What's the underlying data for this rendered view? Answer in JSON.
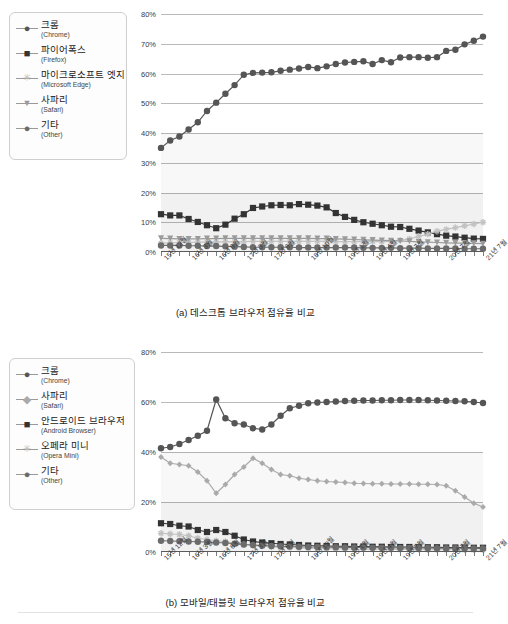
{
  "figures": [
    {
      "id": "a",
      "caption": "(a) 데스크톱 브라우저 점유율 비교",
      "legend": [
        {
          "ko": "크롬",
          "en": "(Chrome)",
          "marker": "circle",
          "color": "#555555"
        },
        {
          "ko": "파이어폭스",
          "en": "(Firefox)",
          "marker": "square",
          "color": "#333333"
        },
        {
          "ko": "마이크로소프트 엣지",
          "en": "(Microsoft Edge)",
          "marker": "star",
          "color": "#bfbfbf"
        },
        {
          "ko": "사파리",
          "en": "(Safari)",
          "marker": "triangle-down",
          "color": "#9a9a9a"
        },
        {
          "ko": "기타",
          "en": "(Other)",
          "marker": "circle",
          "color": "#6b6b6b"
        }
      ],
      "chart_data": {
        "type": "line",
        "title": "",
        "subtitle": "",
        "xlabel": "",
        "ylabel": "",
        "ylim": [
          0,
          80
        ],
        "yticks": [
          "0%",
          "10%",
          "20%",
          "30%",
          "40%",
          "50%",
          "60%",
          "70%",
          "80%"
        ],
        "ytick_values": [
          0,
          10,
          20,
          30,
          40,
          50,
          60,
          70,
          80
        ],
        "grid": true,
        "legend_position": "outside-left",
        "x_tick_labels": [
          "15년 12월",
          "16년 3월",
          "16년 6월",
          "17년 3월",
          "17년 6월",
          "18년 10월",
          "19년 1월",
          "19년 4월",
          "19년 7월",
          "20년 7월",
          "21년 7월"
        ],
        "x_tick_indices": [
          0,
          3,
          6,
          9,
          12,
          16,
          20,
          23,
          26,
          31,
          35
        ],
        "n_points": 36,
        "series": [
          {
            "name": "크롬 (Chrome)",
            "marker": "circle",
            "color": "#555555",
            "values": [
              35.0,
              37.5,
              38.8,
              41.2,
              43.6,
              47.4,
              50.2,
              53.2,
              56.1,
              59.6,
              60.2,
              60.3,
              60.4,
              60.9,
              61.3,
              61.7,
              62.2,
              61.8,
              62.4,
              63.2,
              63.7,
              63.9,
              64.1,
              63.2,
              64.5,
              63.8,
              65.4,
              65.5,
              65.5,
              65.3,
              65.5,
              67.6,
              68.0,
              69.8,
              71.0,
              72.4
            ]
          },
          {
            "name": "파이어폭스 (Firefox)",
            "marker": "square",
            "color": "#333333",
            "values": [
              12.7,
              12.3,
              12.3,
              11.1,
              10.1,
              9.0,
              8.0,
              9.2,
              11.2,
              12.7,
              14.8,
              15.3,
              15.7,
              15.8,
              15.7,
              16.1,
              15.9,
              15.6,
              15.0,
              13.1,
              11.8,
              10.8,
              10.0,
              9.5,
              9.0,
              8.5,
              8.4,
              7.8,
              7.2,
              6.6,
              6.0,
              5.5,
              5.2,
              4.8,
              4.5,
              4.4
            ]
          },
          {
            "name": "마이크로소프트 엣지 (Microsoft Edge)",
            "marker": "star",
            "color": "#c2c2c2",
            "values": [
              3.0,
              3.1,
              3.2,
              3.2,
              3.3,
              3.3,
              3.4,
              3.4,
              3.5,
              3.5,
              3.6,
              3.6,
              3.6,
              3.6,
              3.6,
              3.6,
              3.6,
              3.6,
              3.6,
              3.5,
              3.5,
              3.5,
              3.5,
              3.5,
              3.5,
              3.6,
              4.0,
              4.4,
              5.2,
              6.0,
              7.0,
              7.6,
              8.2,
              8.8,
              9.4,
              10.0
            ]
          },
          {
            "name": "사파리 (Safari)",
            "marker": "triangle-down",
            "color": "#9a9a9a",
            "values": [
              4.6,
              4.5,
              4.4,
              4.4,
              4.4,
              4.5,
              4.5,
              4.6,
              4.6,
              4.6,
              4.6,
              4.6,
              4.6,
              4.6,
              4.6,
              4.6,
              4.6,
              4.5,
              4.5,
              4.4,
              4.3,
              4.2,
              4.1,
              4.0,
              3.9,
              3.8,
              3.7,
              3.6,
              3.4,
              3.3,
              3.2,
              3.1,
              3.0,
              3.0,
              2.9,
              2.8
            ]
          },
          {
            "name": "기타 (Other)",
            "marker": "circle",
            "color": "#6b6b6b",
            "values": [
              2.2,
              2.2,
              2.2,
              2.1,
              2.1,
              2.0,
              2.0,
              1.9,
              1.8,
              1.7,
              1.6,
              1.6,
              1.6,
              1.6,
              1.6,
              1.5,
              1.5,
              1.5,
              1.5,
              1.5,
              1.5,
              1.5,
              1.4,
              1.4,
              1.4,
              1.4,
              1.3,
              1.3,
              1.3,
              1.2,
              1.2,
              1.2,
              1.2,
              1.1,
              1.1,
              1.1
            ]
          }
        ]
      }
    },
    {
      "id": "b",
      "caption": "(b) 모바일/태블릿 브라우저 점유율 비교",
      "legend": [
        {
          "ko": "크롬",
          "en": "(Chrome)",
          "marker": "circle",
          "color": "#555555"
        },
        {
          "ko": "사파리",
          "en": "(Safari)",
          "marker": "diamond",
          "color": "#aaaaaa"
        },
        {
          "ko": "안드로이드 브라우저",
          "en": "(Android Browser)",
          "marker": "square",
          "color": "#333333"
        },
        {
          "ko": "오페라 미니",
          "en": "(Opera Mini)",
          "marker": "star",
          "color": "#bfbfbf"
        },
        {
          "ko": "기타",
          "en": "(Other)",
          "marker": "circle",
          "color": "#6b6b6b"
        }
      ],
      "chart_data": {
        "type": "line",
        "title": "",
        "subtitle": "",
        "xlabel": "",
        "ylabel": "",
        "ylim": [
          0,
          80
        ],
        "yticks": [
          "0%",
          "20%",
          "40%",
          "60%",
          "80%"
        ],
        "ytick_values": [
          0,
          20,
          40,
          60,
          80
        ],
        "grid": true,
        "legend_position": "outside-left",
        "x_tick_labels": [
          "15년 12월",
          "16년 3월",
          "16년 6월",
          "17년 3월",
          "17년 6월",
          "18년 10월",
          "19년 1월",
          "19년 4월",
          "19년 7월",
          "20년 7월",
          "21년 7월"
        ],
        "x_tick_indices": [
          0,
          3,
          6,
          9,
          12,
          16,
          20,
          23,
          26,
          31,
          35
        ],
        "n_points": 36,
        "series": [
          {
            "name": "크롬 (Chrome)",
            "marker": "circle",
            "color": "#555555",
            "values": [
              41.5,
              42.0,
              43.2,
              44.8,
              46.5,
              48.5,
              61.0,
              53.5,
              51.5,
              51.0,
              49.5,
              49.0,
              51.0,
              54.5,
              57.5,
              58.5,
              59.5,
              59.8,
              60.0,
              60.2,
              60.4,
              60.5,
              60.6,
              60.6,
              60.7,
              60.7,
              60.8,
              60.8,
              60.8,
              60.7,
              60.6,
              60.5,
              60.4,
              60.3,
              60.0,
              59.6
            ]
          },
          {
            "name": "사파리 (Safari)",
            "marker": "diamond",
            "color": "#aaaaaa",
            "values": [
              38.0,
              35.5,
              35.0,
              34.5,
              32.0,
              28.5,
              23.5,
              27.0,
              31.0,
              34.0,
              37.5,
              35.5,
              33.0,
              31.0,
              30.5,
              29.5,
              29.0,
              28.5,
              28.2,
              28.0,
              27.8,
              27.5,
              27.4,
              27.3,
              27.3,
              27.2,
              27.2,
              27.2,
              27.1,
              27.1,
              27.0,
              26.5,
              24.5,
              22.0,
              19.5,
              18.0
            ]
          },
          {
            "name": "안드로이드 브라우저 (Android Browser)",
            "marker": "square",
            "color": "#333333",
            "values": [
              11.5,
              11.2,
              10.5,
              10.2,
              8.8,
              8.0,
              8.8,
              8.0,
              6.5,
              5.0,
              4.2,
              3.8,
              3.5,
              3.2,
              3.0,
              2.8,
              2.6,
              2.5,
              2.4,
              2.3,
              2.3,
              2.2,
              2.2,
              2.1,
              2.1,
              2.0,
              2.0,
              2.0,
              1.9,
              1.9,
              1.9,
              1.8,
              1.8,
              1.8,
              1.7,
              1.7
            ]
          },
          {
            "name": "오페라 미니 (Opera Mini)",
            "marker": "star",
            "color": "#bfbfbf",
            "values": [
              7.5,
              7.2,
              7.0,
              6.5,
              5.5,
              5.0,
              4.5,
              4.2,
              3.5,
              3.0,
              2.6,
              2.3,
              2.0,
              1.9,
              1.8,
              1.6,
              1.5,
              1.4,
              1.3,
              1.3,
              1.2,
              1.2,
              1.1,
              1.1,
              1.1,
              1.0,
              1.0,
              1.0,
              1.0,
              0.9,
              0.9,
              0.9,
              0.9,
              0.8,
              0.8,
              0.8
            ]
          },
          {
            "name": "기타 (Other)",
            "marker": "circle",
            "color": "#6b6b6b",
            "values": [
              4.5,
              4.4,
              4.3,
              4.2,
              4.1,
              4.0,
              3.8,
              3.6,
              3.3,
              3.0,
              2.8,
              2.6,
              2.4,
              2.3,
              2.2,
              2.1,
              2.0,
              2.0,
              1.9,
              1.9,
              1.8,
              1.8,
              1.8,
              1.7,
              1.7,
              1.7,
              1.6,
              1.6,
              1.6,
              1.6,
              1.5,
              1.5,
              1.5,
              1.5,
              1.4,
              1.4
            ]
          }
        ]
      }
    }
  ]
}
